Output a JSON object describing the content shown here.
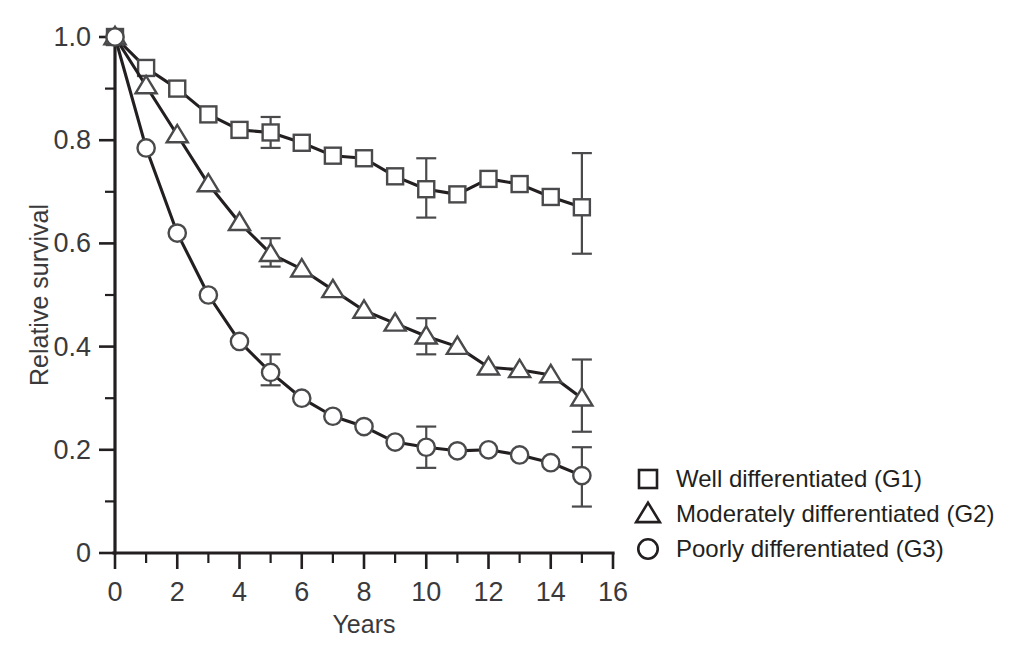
{
  "chart_data": {
    "type": "line",
    "title": "",
    "xlabel": "Years",
    "ylabel": "Relative survival",
    "xlim": [
      0,
      16
    ],
    "ylim": [
      0,
      1.0
    ],
    "grid": false,
    "legend_position": "right",
    "x_ticks_major": [
      0,
      2,
      4,
      6,
      8,
      10,
      12,
      14,
      16
    ],
    "x_tick_labels": [
      "0",
      "2",
      "4",
      "6",
      "8",
      "10",
      "12",
      "14",
      "16"
    ],
    "x_ticks_minor": [
      1,
      3,
      5,
      7,
      9,
      11,
      13,
      15
    ],
    "y_ticks_major": [
      0,
      0.2,
      0.4,
      0.6,
      0.8,
      1.0
    ],
    "y_tick_labels": [
      "0",
      "0.2",
      "0.4",
      "0.6",
      "0.8",
      "1.0"
    ],
    "y_ticks_minor": [
      0.1,
      0.3,
      0.5,
      0.7,
      0.9
    ],
    "x": [
      0,
      1,
      2,
      3,
      4,
      5,
      6,
      7,
      8,
      9,
      10,
      11,
      12,
      13,
      14,
      15
    ],
    "series": [
      {
        "name": "Well differentiated (G1)",
        "marker": "square",
        "values": [
          1.0,
          0.94,
          0.9,
          0.85,
          0.82,
          0.815,
          0.795,
          0.77,
          0.765,
          0.73,
          0.705,
          0.695,
          0.725,
          0.715,
          0.69,
          0.67
        ],
        "error_bars": [
          {
            "x": 5,
            "y": 0.815,
            "low": 0.785,
            "high": 0.845
          },
          {
            "x": 10,
            "y": 0.705,
            "low": 0.65,
            "high": 0.765
          },
          {
            "x": 15,
            "y": 0.67,
            "low": 0.58,
            "high": 0.775
          }
        ]
      },
      {
        "name": "Moderately differentiated (G2)",
        "marker": "triangle",
        "values": [
          1.0,
          0.905,
          0.81,
          0.715,
          0.64,
          0.58,
          0.55,
          0.51,
          0.47,
          0.445,
          0.42,
          0.4,
          0.36,
          0.355,
          0.345,
          0.3
        ],
        "error_bars": [
          {
            "x": 5,
            "y": 0.58,
            "low": 0.555,
            "high": 0.61
          },
          {
            "x": 10,
            "y": 0.42,
            "low": 0.385,
            "high": 0.455
          },
          {
            "x": 15,
            "y": 0.3,
            "low": 0.235,
            "high": 0.375
          }
        ]
      },
      {
        "name": "Poorly differentiated (G3)",
        "marker": "circle",
        "values": [
          1.0,
          0.785,
          0.62,
          0.5,
          0.41,
          0.35,
          0.3,
          0.265,
          0.245,
          0.215,
          0.205,
          0.198,
          0.2,
          0.19,
          0.175,
          0.15
        ],
        "error_bars": [
          {
            "x": 5,
            "y": 0.35,
            "low": 0.325,
            "high": 0.385
          },
          {
            "x": 10,
            "y": 0.205,
            "low": 0.165,
            "high": 0.245
          },
          {
            "x": 15,
            "y": 0.15,
            "low": 0.09,
            "high": 0.205
          }
        ]
      }
    ],
    "legend": [
      {
        "marker": "square",
        "label": "Well differentiated (G1)"
      },
      {
        "marker": "triangle",
        "label": "Moderately differentiated (G2)"
      },
      {
        "marker": "circle",
        "label": "Poorly differentiated (G3)"
      }
    ]
  },
  "colors": {
    "ink": "#231f20",
    "marker_stroke": "#4a4a4c",
    "background": "#ffffff",
    "tick_label": "#3a3a3c"
  }
}
